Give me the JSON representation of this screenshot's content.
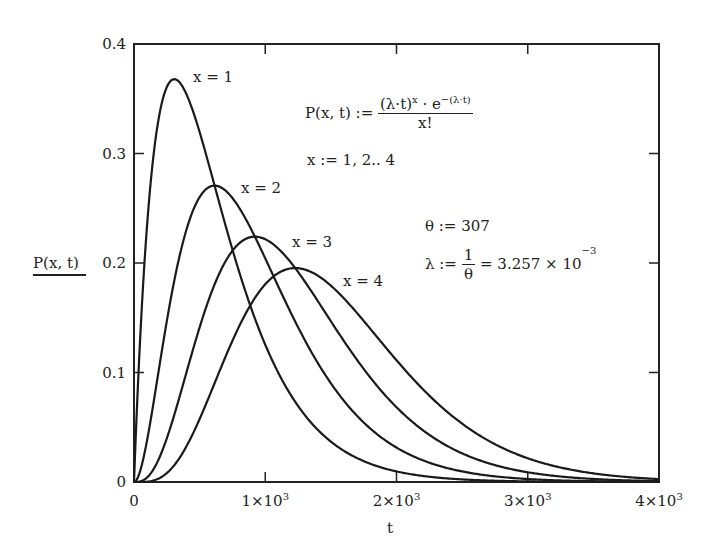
{
  "chart_data": {
    "type": "line",
    "title": "",
    "xlabel": "t",
    "ylabel": "P(x, t)",
    "xlim": [
      0,
      4000
    ],
    "ylim": [
      0,
      0.4
    ],
    "grid": false,
    "x_ticks": [
      "0",
      "1×10³",
      "2×10³",
      "3×10³",
      "4×10³"
    ],
    "y_ticks": [
      "0",
      "0.1",
      "0.2",
      "0.3",
      "0.4"
    ],
    "formula": "P(x,t) = (λ·t)^x · e^-(λ·t) / x!",
    "parameters": {
      "theta": 307,
      "lambda": 0.003257
    },
    "series": [
      {
        "name": "x = 1",
        "x_param": 1,
        "peak_t": 307,
        "peak_value": 0.368,
        "t": [
          0,
          500,
          1000,
          1500,
          2000,
          2500,
          3000,
          3500,
          4000
        ],
        "values": [
          0,
          0.32,
          0.125,
          0.037,
          0.01,
          0.002,
          0.0006,
          0.0001,
          3e-05
        ]
      },
      {
        "name": "x = 2",
        "x_param": 2,
        "peak_t": 614,
        "peak_value": 0.271,
        "t": [
          0,
          500,
          1000,
          1500,
          2000,
          2500,
          3000,
          3500,
          4000
        ],
        "values": [
          0,
          0.261,
          0.204,
          0.091,
          0.032,
          0.01,
          0.003,
          0.0007,
          0.0002
        ]
      },
      {
        "name": "x = 3",
        "x_param": 3,
        "peak_t": 921,
        "peak_value": 0.224,
        "t": [
          0,
          500,
          1000,
          1500,
          2000,
          2500,
          3000,
          3500,
          4000
        ],
        "values": [
          0,
          0.141,
          0.221,
          0.148,
          0.07,
          0.027,
          0.009,
          0.003,
          0.0009
        ]
      },
      {
        "name": "x = 4",
        "x_param": 4,
        "peak_t": 1228,
        "peak_value": 0.195,
        "t": [
          0,
          500,
          1000,
          1500,
          2000,
          2500,
          3000,
          3500,
          4000
        ],
        "values": [
          0,
          0.057,
          0.18,
          0.18,
          0.114,
          0.055,
          0.022,
          0.008,
          0.003
        ]
      }
    ]
  },
  "annotations": {
    "p_lhs": "P(x, t) :=",
    "p_num": "(λ·t)",
    "p_num_sup": "x",
    "p_num_mid": " · e",
    "p_num_sup2": "−(λ·t)",
    "p_den": "x!",
    "x_range": "x := 1, 2.. 4",
    "theta_def": "θ := 307",
    "lambda_lhs": "λ :=",
    "lambda_num": "1",
    "lambda_den": "θ",
    "lambda_result": "= 3.257 × 10",
    "lambda_exp": "−3"
  },
  "labels": {
    "x1": "x = 1",
    "x2": "x = 2",
    "x3": "x = 3",
    "x4": "x = 4"
  }
}
